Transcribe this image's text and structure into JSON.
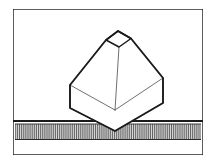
{
  "figure": {
    "title": "Octahedral solid balanced on apex over hatched ground",
    "type": "technical-line-drawing",
    "width": 215,
    "height": 164,
    "background_color": "#ffffff",
    "line_color": "#1a1a1a",
    "thin_line_color": "#555555",
    "hatch_color": "#3a3a3a",
    "hatch_band_fill": "#d9d9d9",
    "frame": {
      "label": "drawing-frame",
      "x": 13,
      "y": 9,
      "width": 190,
      "height": 146,
      "stroke_width": 1.4
    },
    "ground": {
      "label": "ground-surface",
      "top_rule_y": 121,
      "top_rule_stroke_width": 2.2,
      "band_top": 124,
      "band_bottom": 139,
      "band_left": 15,
      "band_right": 201,
      "hatch_spacing": 1.9,
      "hatch_stroke_width": 0.75,
      "bottom_rule_y": 139.5
    },
    "solid": {
      "label": "octahedral-solid",
      "top_face": {
        "label": "top-face",
        "points": "118,31 131,38.5 119,47 106,40"
      },
      "upper_left_face": {
        "label": "upper-left-face",
        "points": "118,31 106,40 70,85 115,110 119,47"
      },
      "upper_right_face": {
        "label": "upper-right-face",
        "points": "118,31 131,38.5 163,78 115,110 119,47"
      },
      "lower_left_face": {
        "label": "lower-left-face",
        "points": "70,85 70,108 115,131 115,110"
      },
      "lower_right_face": {
        "label": "lower-right-face",
        "points": "163,78 163,103 115,131 115,110"
      },
      "outline": {
        "label": "solid-outline",
        "points": "118,31 131,38.5 163,78 163,103 115,131 70,108 70,85 106,40"
      },
      "interior_edges": [
        {
          "label": "front-vertical-edge",
          "x1": 119,
          "y1": 47,
          "x2": 115,
          "y2": 110
        },
        {
          "label": "left-upper-ridge",
          "x1": 106,
          "y1": 40,
          "x2": 70,
          "y2": 85
        },
        {
          "label": "right-upper-ridge",
          "x1": 131,
          "y1": 38.5,
          "x2": 163,
          "y2": 78
        },
        {
          "label": "left-mid-edge",
          "x1": 70,
          "y1": 85,
          "x2": 115,
          "y2": 110
        },
        {
          "label": "right-mid-edge",
          "x1": 163,
          "y1": 78,
          "x2": 115,
          "y2": 110
        },
        {
          "label": "left-band-edge",
          "x1": 70,
          "y1": 108,
          "x2": 115,
          "y2": 131
        },
        {
          "label": "right-band-edge",
          "x1": 163,
          "y1": 103,
          "x2": 115,
          "y2": 131
        }
      ],
      "apex": {
        "label": "bottom-apex",
        "x": 115,
        "y": 131
      }
    }
  }
}
